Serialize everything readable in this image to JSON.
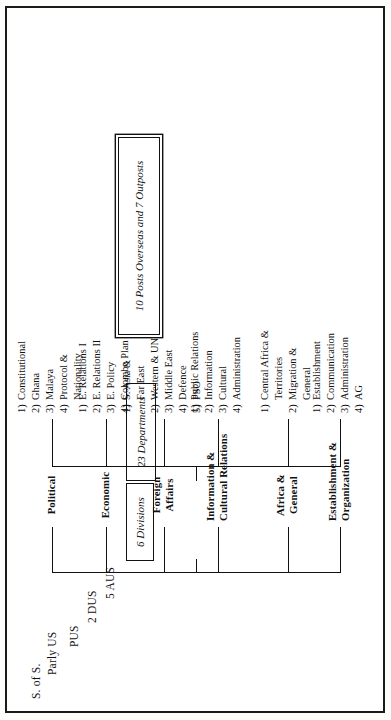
{
  "document": {
    "type": "organisation-chart",
    "orientation": "rotated-90-ccw"
  },
  "executive": {
    "title": "Executive hierarchy",
    "rows": [
      "S. of S.",
      "Parly US",
      "PUS",
      "2 DUS",
      "5 AUS"
    ]
  },
  "boxes": {
    "divisions": "6 Divisions",
    "departments": "23 Departments",
    "posts": "10 Posts Overseas and 7 Outposts"
  },
  "divisions": [
    {
      "label": "Establishment &\nOrganization",
      "departments": [
        {
          "num": "1)",
          "text": "Establishment"
        },
        {
          "num": "2)",
          "text": "Communication"
        },
        {
          "num": "3)",
          "text": "Administration"
        },
        {
          "num": "4)",
          "text": "AG"
        }
      ]
    },
    {
      "label": "Africa &\nGeneral",
      "departments": [
        {
          "num": "1)",
          "text": "Central Africa &",
          "cont": "Territories"
        },
        {
          "num": "2)",
          "text": "Migration &",
          "cont": "General"
        }
      ]
    },
    {
      "label": "Information &\nCultural Relations",
      "departments": [
        {
          "num": "1)",
          "text": "Public Relations"
        },
        {
          "num": "2)",
          "text": "Information"
        },
        {
          "num": "3)",
          "text": "Cultural"
        },
        {
          "num": "4)",
          "text": "Administration"
        }
      ]
    },
    {
      "label": "Foreign\nAffairs",
      "departments": [
        {
          "num": "1)",
          "text": "S. Asia &",
          "cont": "Far East"
        },
        {
          "num": "2)",
          "text": "Western & UN"
        },
        {
          "num": "3)",
          "text": "Middle East"
        },
        {
          "num": "4)",
          "text": "Defence"
        },
        {
          "num": "5)",
          "text": "PSO"
        }
      ]
    },
    {
      "label": "Economic",
      "departments": [
        {
          "num": "1)",
          "text": "E. Relations I"
        },
        {
          "num": "2)",
          "text": "E. Relations II"
        },
        {
          "num": "3)",
          "text": "E. Policy"
        },
        {
          "num": "4)",
          "text": "Colombo Plan"
        }
      ]
    },
    {
      "label": "Political",
      "departments": [
        {
          "num": "1)",
          "text": "Constitutional"
        },
        {
          "num": "2)",
          "text": "Ghana"
        },
        {
          "num": "3)",
          "text": "Malaya"
        },
        {
          "num": "4)",
          "text": "Protocol &",
          "cont": "Nationality"
        }
      ]
    }
  ],
  "colors": {
    "ink": "#111111",
    "paper": "#ffffff"
  }
}
